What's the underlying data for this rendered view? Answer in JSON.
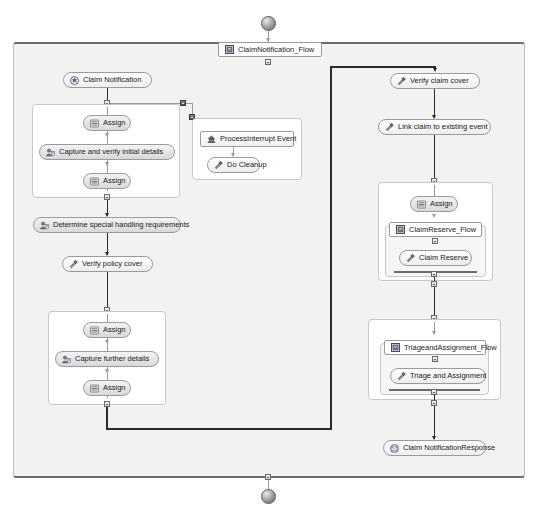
{
  "diagram": {
    "title": "ClaimNotification_Flow",
    "type": "bpm-process-flow",
    "start_node": "start-event",
    "end_node": "end-event",
    "accent_color": "#2b2b2b",
    "pool_background": "#f2f2f2",
    "node_border": "#9b9b9b"
  },
  "nodes": {
    "process_header": "ClaimNotification_Flow",
    "claim_notification": "Claim Notification",
    "assign_1": "Assign",
    "capture_initial": "Capture and verify initial details",
    "assign_2": "Assign",
    "determine_special": "Determine special handling requirements",
    "verify_policy": "Verify policy cover",
    "assign_3": "Assign",
    "capture_further": "Capture further details",
    "assign_4": "Assign",
    "process_interrupt": "ProcessInterrupt Event",
    "do_cleanup": "Do Cleanup",
    "verify_claim_cover": "Verify claim cover",
    "link_claim": "Link claim to existing event",
    "assign_5": "Assign",
    "claim_reserve_flow": "ClaimReserve_Flow",
    "claim_reserve": "Claim Reserve",
    "triage_flow": "TriageandAssignment_Flow",
    "triage_assignment": "Triage and Assignment",
    "claim_response": "Claim NotificationResponse"
  },
  "icons": {
    "process_header": "subprocess-icon",
    "claim_notification": "message-event-icon",
    "assign": "assign-list-icon",
    "capture": "user-task-icon",
    "verify": "service-task-icon",
    "interrupt": "interrupt-event-icon",
    "subflow": "subprocess-icon",
    "response": "message-response-icon"
  }
}
